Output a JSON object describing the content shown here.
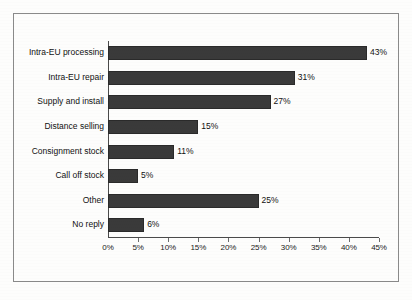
{
  "chart_data": {
    "type": "bar",
    "orientation": "horizontal",
    "title": "",
    "xlabel": "",
    "ylabel": "",
    "categories": [
      "Intra-EU processing",
      "Intra-EU repair",
      "Supply and install",
      "Distance selling",
      "Consignment stock",
      "Call off stock",
      "Other",
      "No reply"
    ],
    "values": [
      43,
      31,
      27,
      15,
      11,
      5,
      25,
      6
    ],
    "value_labels": [
      "43%",
      "31%",
      "27%",
      "15%",
      "11%",
      "5%",
      "25%",
      "6%"
    ],
    "xlim": [
      0,
      45
    ],
    "xticks": [
      0,
      5,
      10,
      15,
      20,
      25,
      30,
      35,
      40,
      45
    ],
    "xtick_labels": [
      "0%",
      "5%",
      "10%",
      "15%",
      "20%",
      "25%",
      "30%",
      "35%",
      "40%",
      "45%"
    ],
    "grid": false,
    "legend": null,
    "bar_color": "#3a3a3a",
    "bar_edge_color": "#2a2a2a",
    "axis_color": "#4a4a4a",
    "background_color": "#fdfdfc",
    "frame_color": "#8a8a8a"
  }
}
